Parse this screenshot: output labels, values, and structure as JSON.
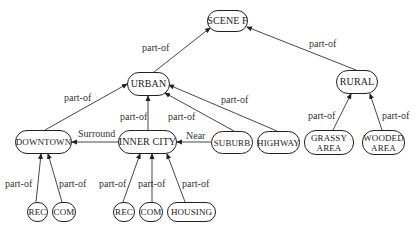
{
  "diagram": {
    "type": "semantic network",
    "nodes": {
      "scene_f": {
        "label": "SCENE F"
      },
      "urban": {
        "label": "URBAN"
      },
      "rural": {
        "label": "RURAL"
      },
      "downtown": {
        "label": "DOWNTOWN"
      },
      "inner_city": {
        "label": "INNER CITY"
      },
      "suburb": {
        "label": "SUBURB"
      },
      "highway": {
        "label": "HIGHWAY"
      },
      "grassy_area": {
        "line1": "GRASSY",
        "line2": "AREA"
      },
      "wooded_area": {
        "line1": "WOODED",
        "line2": "AREA"
      },
      "rec_downtown": {
        "label": "REC"
      },
      "com_downtown": {
        "label": "COM"
      },
      "rec_inner": {
        "label": "REC"
      },
      "com_inner": {
        "label": "COM"
      },
      "housing": {
        "label": "HOUSING"
      }
    },
    "edges": [
      {
        "from": "urban",
        "to": "scene_f",
        "label": "part-of"
      },
      {
        "from": "rural",
        "to": "scene_f",
        "label": "part-of"
      },
      {
        "from": "downtown",
        "to": "urban",
        "label": "part-of"
      },
      {
        "from": "inner_city",
        "to": "urban",
        "label": "part-of"
      },
      {
        "from": "suburb",
        "to": "urban",
        "label": "part-of"
      },
      {
        "from": "highway",
        "to": "urban",
        "label": "part-of"
      },
      {
        "from": "grassy_area",
        "to": "rural",
        "label": "part-of"
      },
      {
        "from": "wooded_area",
        "to": "rural",
        "label": "part-of"
      },
      {
        "from": "inner_city",
        "to": "downtown",
        "label": "Surround"
      },
      {
        "from": "suburb",
        "to": "inner_city",
        "label": "Near"
      },
      {
        "from": "rec_downtown",
        "to": "downtown",
        "label": "part-of"
      },
      {
        "from": "com_downtown",
        "to": "downtown",
        "label": "part-of"
      },
      {
        "from": "rec_inner",
        "to": "inner_city",
        "label": "part-of"
      },
      {
        "from": "com_inner",
        "to": "inner_city",
        "label": "part-of"
      },
      {
        "from": "housing",
        "to": "inner_city",
        "label": "part-of"
      }
    ]
  }
}
